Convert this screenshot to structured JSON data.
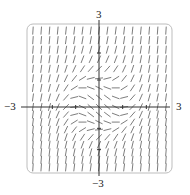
{
  "figure": {
    "type": "slope_field",
    "axis_labels": {
      "y_top": "3",
      "y_bottom": "−3",
      "x_left": "−3",
      "x_right": "3"
    },
    "colors": {
      "frame": "#bdbdbd",
      "axes": "#333333",
      "segments": "#6e6e6e",
      "background": "#ffffff"
    }
  },
  "chart_data": {
    "type": "slope_field",
    "title": "",
    "xlabel": "",
    "ylabel": "",
    "xlim": [
      -3,
      3
    ],
    "ylim": [
      -3,
      3
    ],
    "tick_labels": {
      "x": [
        "-3",
        "3"
      ],
      "y": [
        "-3",
        "3"
      ]
    },
    "grid": {
      "nx": 17,
      "ny": 17
    },
    "equation_estimate": "dy/dx = x^2 + y^2 - 1",
    "grid_on": false,
    "legend": null
  },
  "layout": {
    "origin_px": [
      99,
      107
    ],
    "frame_px": {
      "x0": 27,
      "y0": 24,
      "x1": 172,
      "y1": 173,
      "radius": 6
    },
    "x_axis_px": {
      "x0": 21,
      "x1": 170
    },
    "y_axis_px": {
      "y0": 20,
      "y1": 176
    },
    "segment_length_px": 8
  }
}
